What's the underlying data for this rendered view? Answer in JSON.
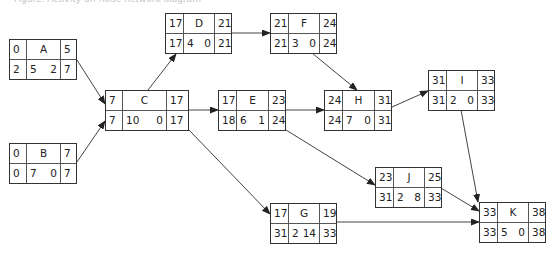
{
  "caption": "Figure: Activity-on-node network diagram",
  "diagram": {
    "type": "activity-on-node network",
    "legend_layout": "top row: ES | Activity | EF ; bottom row: LS | Duration  Float | LF",
    "nodes": {
      "A": {
        "name": "A",
        "es": "0",
        "ef": "5",
        "ls": "2",
        "dur": "5",
        "float": "2",
        "lf": "7"
      },
      "B": {
        "name": "B",
        "es": "0",
        "ef": "7",
        "ls": "0",
        "dur": "7",
        "float": "0",
        "lf": "7"
      },
      "C": {
        "name": "C",
        "es": "7",
        "ef": "17",
        "ls": "7",
        "dur": "10",
        "float": "0",
        "lf": "17"
      },
      "D": {
        "name": "D",
        "es": "17",
        "ef": "21",
        "ls": "17",
        "dur": "4",
        "float": "0",
        "lf": "21"
      },
      "E": {
        "name": "E",
        "es": "17",
        "ef": "23",
        "ls": "18",
        "dur": "6",
        "float": "1",
        "lf": "24"
      },
      "F": {
        "name": "F",
        "es": "21",
        "ef": "24",
        "ls": "21",
        "dur": "3",
        "float": "0",
        "lf": "24"
      },
      "G": {
        "name": "G",
        "es": "17",
        "ef": "19",
        "ls": "31",
        "dur": "2",
        "float": "14",
        "lf": "33"
      },
      "H": {
        "name": "H",
        "es": "24",
        "ef": "31",
        "ls": "24",
        "dur": "7",
        "float": "0",
        "lf": "31"
      },
      "I": {
        "name": "I",
        "es": "31",
        "ef": "33",
        "ls": "31",
        "dur": "2",
        "float": "0",
        "lf": "33"
      },
      "J": {
        "name": "J",
        "es": "23",
        "ef": "25",
        "ls": "31",
        "dur": "2",
        "float": "8",
        "lf": "33"
      },
      "K": {
        "name": "K",
        "es": "33",
        "ef": "38",
        "ls": "33",
        "dur": "5",
        "float": "0",
        "lf": "38"
      }
    },
    "edges": [
      [
        "A",
        "C"
      ],
      [
        "B",
        "C"
      ],
      [
        "C",
        "D"
      ],
      [
        "C",
        "E"
      ],
      [
        "C",
        "G"
      ],
      [
        "D",
        "F"
      ],
      [
        "F",
        "H"
      ],
      [
        "E",
        "H"
      ],
      [
        "E",
        "J"
      ],
      [
        "H",
        "I"
      ],
      [
        "I",
        "K"
      ],
      [
        "J",
        "K"
      ],
      [
        "G",
        "K"
      ]
    ],
    "colors": {
      "line": "#333333",
      "background": "#ffffff"
    }
  }
}
